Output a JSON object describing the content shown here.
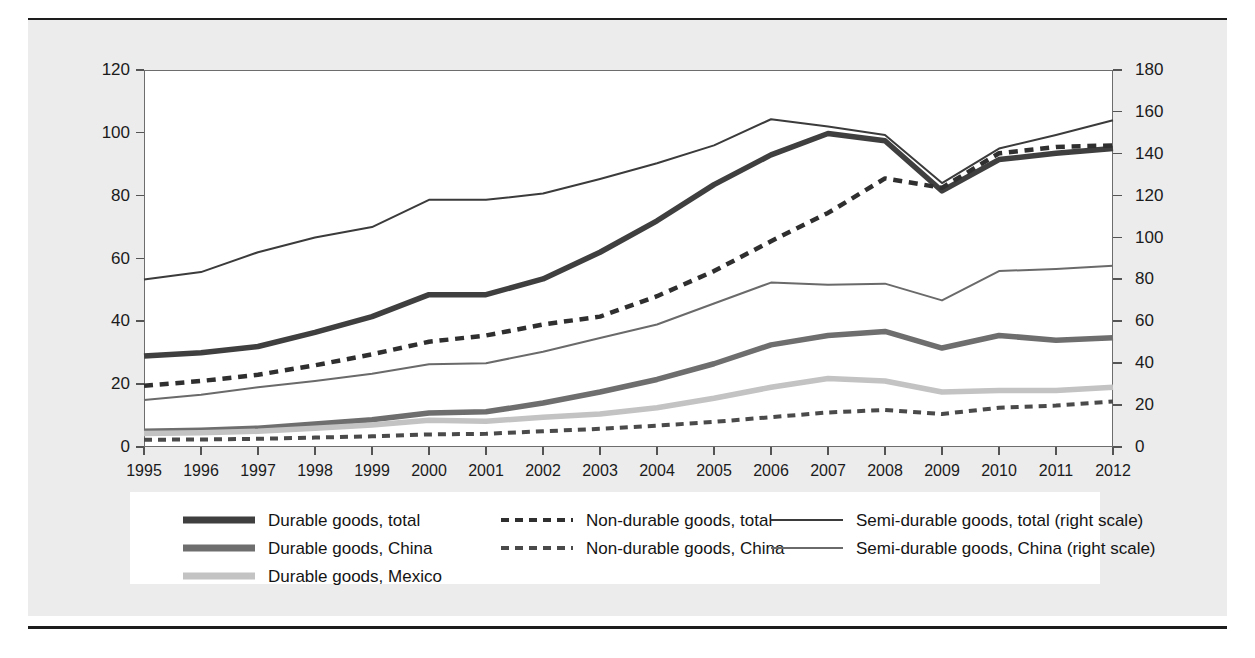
{
  "chart_data": {
    "type": "line",
    "title": "",
    "subtitle": "",
    "xlabel": "",
    "ylabel": "",
    "y2label": "",
    "grid": false,
    "legend_position": "bottom",
    "x": [
      1995,
      1996,
      1997,
      1998,
      1999,
      2000,
      2001,
      2002,
      2003,
      2004,
      2005,
      2006,
      2007,
      2008,
      2009,
      2010,
      2011,
      2012
    ],
    "xtick_labels": [
      "1995",
      "1996",
      "1997",
      "1998",
      "1999",
      "2000",
      "2001",
      "2002",
      "2003",
      "2004",
      "2005",
      "2006",
      "2007",
      "2008",
      "2009",
      "2010",
      "2011",
      "2012"
    ],
    "ylim": [
      0,
      120
    ],
    "ytick_labels": [
      "0",
      "20",
      "40",
      "60",
      "80",
      "100",
      "120"
    ],
    "yticks": [
      0,
      20,
      40,
      60,
      80,
      100,
      120
    ],
    "y2lim": [
      0,
      180
    ],
    "y2tick_labels": [
      "0",
      "20",
      "40",
      "60",
      "80",
      "100",
      "120",
      "140",
      "160",
      "180"
    ],
    "y2ticks": [
      0,
      20,
      40,
      60,
      80,
      100,
      120,
      140,
      160,
      180
    ],
    "series": [
      {
        "name": "Durable goods, total",
        "axis": "left",
        "style": "solid",
        "width": 5.5,
        "color": "#3f3f3f",
        "values": [
          29.0,
          30.0,
          32.0,
          36.5,
          41.5,
          48.5,
          48.5,
          53.5,
          62.0,
          72.0,
          83.5,
          93.0,
          99.8,
          97.5,
          81.5,
          91.5,
          93.5,
          95.0
        ]
      },
      {
        "name": "Durable goods, China",
        "axis": "left",
        "style": "solid",
        "width": 5.5,
        "color": "#6e6e6e",
        "values": [
          5.0,
          5.3,
          6.0,
          7.3,
          8.7,
          10.8,
          11.2,
          14.0,
          17.5,
          21.5,
          26.5,
          32.5,
          35.5,
          36.8,
          31.5,
          35.5,
          34.0,
          34.8
        ]
      },
      {
        "name": "Durable goods, Mexico",
        "axis": "left",
        "style": "solid",
        "width": 5.5,
        "color": "#c3c3c3",
        "values": [
          4.3,
          4.5,
          5.0,
          6.0,
          7.0,
          8.5,
          8.2,
          9.5,
          10.5,
          12.5,
          15.5,
          19.0,
          21.8,
          21.0,
          17.5,
          18.0,
          18.0,
          19.0
        ]
      },
      {
        "name": "Non-durable goods, total",
        "axis": "left",
        "style": "dashed",
        "width": 4.5,
        "color": "#2f2f2f",
        "values": [
          19.5,
          21.0,
          23.0,
          26.0,
          29.5,
          33.5,
          35.5,
          39.0,
          41.5,
          48.0,
          56.0,
          65.5,
          74.5,
          85.5,
          82.5,
          93.5,
          95.5,
          96.0
        ]
      },
      {
        "name": "Non-durable goods, China",
        "axis": "left",
        "style": "dashed",
        "width": 4.0,
        "color": "#4a4a4a",
        "values": [
          2.3,
          2.4,
          2.6,
          3.0,
          3.4,
          4.0,
          4.2,
          5.0,
          5.8,
          6.8,
          8.0,
          9.5,
          11.0,
          11.8,
          10.5,
          12.5,
          13.2,
          14.5
        ]
      },
      {
        "name": "Semi-durable goods, total (right scale)",
        "axis": "right",
        "style": "solid",
        "width": 2.0,
        "color": "#3b3b3b",
        "values": [
          80.0,
          83.5,
          93.0,
          100.0,
          105.0,
          118.0,
          118.0,
          121.0,
          128.0,
          135.5,
          144.0,
          156.5,
          153.0,
          149.0,
          126.0,
          142.5,
          149.0,
          156.0
        ]
      },
      {
        "name": "Semi-durable goods, China (right scale)",
        "axis": "right",
        "style": "solid",
        "width": 2.0,
        "color": "#6a6a6a",
        "values": [
          22.5,
          25.0,
          28.5,
          31.5,
          35.0,
          39.5,
          40.0,
          45.5,
          52.0,
          58.5,
          68.5,
          78.5,
          77.5,
          78.0,
          70.0,
          84.0,
          85.0,
          86.5
        ]
      }
    ]
  },
  "axes": {
    "left_ticks": [
      "120",
      "100",
      "80",
      "60",
      "40",
      "20",
      "0"
    ],
    "right_ticks": [
      "180",
      "160",
      "140",
      "120",
      "100",
      "80",
      "60",
      "40",
      "20",
      "0"
    ],
    "x_ticks": [
      "1995",
      "1996",
      "1997",
      "1998",
      "1999",
      "2000",
      "2001",
      "2002",
      "2003",
      "2004",
      "2005",
      "2006",
      "2007",
      "2008",
      "2009",
      "2010",
      "2011",
      "2012"
    ]
  },
  "legend": {
    "items": [
      {
        "label": "Durable goods, total",
        "style": "solid",
        "color": "#3f3f3f",
        "width": 7,
        "col": 0,
        "row": 0
      },
      {
        "label": "Durable goods, China",
        "style": "solid",
        "color": "#6e6e6e",
        "width": 7,
        "col": 0,
        "row": 1
      },
      {
        "label": "Durable goods, Mexico",
        "style": "solid",
        "color": "#c3c3c3",
        "width": 7,
        "col": 0,
        "row": 2
      },
      {
        "label": "Non-durable goods, total",
        "style": "dashed",
        "color": "#2f2f2f",
        "width": 4,
        "col": 1,
        "row": 0
      },
      {
        "label": "Non-durable goods, China",
        "style": "dashed",
        "color": "#4a4a4a",
        "width": 4,
        "col": 1,
        "row": 1
      },
      {
        "label": "Semi-durable goods, total (right scale)",
        "style": "solid",
        "color": "#3b3b3b",
        "width": 2,
        "col": 2,
        "row": 0
      },
      {
        "label": "Semi-durable goods, China (right scale)",
        "style": "solid",
        "color": "#6a6a6a",
        "width": 2,
        "col": 2,
        "row": 1
      }
    ]
  },
  "colors": {
    "page_background": "#ececed",
    "plot_background": "#ffffff",
    "axis": "#6d6d6d",
    "text": "#1b1b1b",
    "rule": "#1d1d1d"
  }
}
